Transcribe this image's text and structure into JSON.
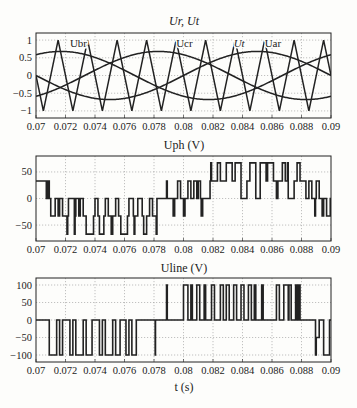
{
  "figure": {
    "plot1_title": "Ur, Ut",
    "plot2_title": "Uph (V)",
    "plot3_title": "Uline (V)",
    "xlabel": "t (s)"
  },
  "chart_data": [
    {
      "type": "line",
      "title": "Ur, Ut",
      "xlabel": "",
      "ylabel": "",
      "xlim": [
        0.07,
        0.09
      ],
      "ylim": [
        -1.2,
        1.2
      ],
      "xticks": [
        "0.07",
        "0.072",
        "0.074",
        "0.076",
        "0.078",
        "0.08",
        "0.082",
        "0.084",
        "0.086",
        "0.088",
        "0.09"
      ],
      "yticks": [
        "1",
        "0.5",
        "0",
        "-0.5",
        "-1"
      ],
      "ytick_values": [
        1,
        0.5,
        0,
        -0.5,
        -1
      ],
      "grid": true,
      "annotations": [
        {
          "text": "Ubr",
          "x": 0.0723,
          "y": 0.92
        },
        {
          "text": "Ucr",
          "x": 0.0795,
          "y": 0.92
        },
        {
          "text": "Ut",
          "x": 0.0834,
          "y": 0.92
        },
        {
          "text": "Uar",
          "x": 0.0855,
          "y": 0.92
        }
      ],
      "series": [
        {
          "name": "Ubr",
          "kind": "sine",
          "amplitude": 0.68,
          "frequency_hz": 50,
          "peak_time": 0.0717
        },
        {
          "name": "Ucr",
          "kind": "sine",
          "amplitude": 0.68,
          "frequency_hz": 50,
          "peak_time": 0.0783
        },
        {
          "name": "Uar",
          "kind": "sine",
          "amplitude": 0.68,
          "frequency_hz": 50,
          "peak_time": 0.085
        },
        {
          "name": "Ut",
          "kind": "triangle",
          "amplitude": 1,
          "period": 0.002,
          "peak_time": 0.0715
        }
      ]
    },
    {
      "type": "line",
      "title": "Uph (V)",
      "xlim": [
        0.07,
        0.09
      ],
      "ylim": [
        -80,
        80
      ],
      "xticks": [
        "0.07",
        "0.072",
        "0.074",
        "0.076",
        "0.078",
        "0.08",
        "0.082",
        "0.084",
        "0.086",
        "0.088",
        "0.09"
      ],
      "yticks": [
        "50",
        "0",
        "-50"
      ],
      "ytick_values": [
        50,
        0,
        -50
      ],
      "grid": true,
      "series": [
        {
          "name": "Uph",
          "kind": "step",
          "x": [
            0.07,
            0.0707,
            0.0708,
            0.0709,
            0.071,
            0.0711,
            0.0713,
            0.0715,
            0.0716,
            0.0718,
            0.0721,
            0.07215,
            0.0722,
            0.0726,
            0.07265,
            0.0727,
            0.0729,
            0.073,
            0.0732,
            0.0734,
            0.0737,
            0.0739,
            0.074,
            0.0742,
            0.0743,
            0.0746,
            0.0747,
            0.0749,
            0.0751,
            0.0752,
            0.0754,
            0.0756,
            0.07575,
            0.076,
            0.0762,
            0.0763,
            0.0766,
            0.07665,
            0.0767,
            0.0769,
            0.0772,
            0.0773,
            0.0775,
            0.0777,
            0.0779,
            0.07815,
            0.0782,
            0.0788,
            0.07885,
            0.0789,
            0.0791,
            0.0793,
            0.0794,
            0.0796,
            0.0798,
            0.08,
            0.0801,
            0.0803,
            0.0805,
            0.0807,
            0.0809,
            0.081,
            0.08115,
            0.0812,
            0.0813,
            0.0816,
            0.0818,
            0.08185,
            0.0819,
            0.0821,
            0.0823,
            0.0825,
            0.0827,
            0.0829,
            0.0831,
            0.0833,
            0.0835,
            0.0836,
            0.0839,
            0.0841,
            0.0843,
            0.0845,
            0.0847,
            0.0849,
            0.0851,
            0.0852,
            0.0854,
            0.0856,
            0.0857,
            0.0859,
            0.0861,
            0.0863,
            0.0864,
            0.0867,
            0.0869,
            0.08705,
            0.0871,
            0.0873,
            0.0875,
            0.0877,
            0.0879,
            0.0881,
            0.0883,
            0.0885,
            0.0887,
            0.0889,
            0.08895,
            0.089,
            0.0892,
            0.0894,
            0.0895,
            0.0897,
            0.0899,
            0.08995,
            0.09
          ],
          "y": [
            33,
            0,
            33,
            0,
            -33,
            -33,
            0,
            -33,
            0,
            -33,
            -67,
            -33,
            0,
            -67,
            -33,
            0,
            -33,
            0,
            -33,
            -67,
            -67,
            -33,
            0,
            -33,
            -67,
            -33,
            0,
            -33,
            -67,
            -33,
            0,
            -33,
            -67,
            -67,
            -33,
            0,
            -33,
            -67,
            -33,
            0,
            -33,
            -67,
            -33,
            0,
            -33,
            -67,
            0,
            0,
            33,
            0,
            0,
            -33,
            0,
            33,
            0,
            -33,
            0,
            33,
            0,
            33,
            0,
            33,
            0,
            -33,
            0,
            0,
            33,
            67,
            33,
            33,
            67,
            33,
            33,
            67,
            67,
            33,
            67,
            67,
            0,
            0,
            33,
            67,
            67,
            0,
            0,
            67,
            67,
            33,
            67,
            67,
            33,
            0,
            33,
            67,
            33,
            67,
            0,
            0,
            33,
            67,
            33,
            33,
            0,
            33,
            0,
            -33,
            0,
            33,
            0,
            -33,
            0,
            -33,
            -33,
            0,
            -33,
            33,
            33
          ]
        }
      ]
    },
    {
      "type": "line",
      "title": "Uline (V)",
      "xlabel": "t (s)",
      "xlim": [
        0.07,
        0.09
      ],
      "ylim": [
        -120,
        120
      ],
      "xticks": [
        "0.07",
        "0.072",
        "0.074",
        "0.076",
        "0.078",
        "0.08",
        "0.082",
        "0.084",
        "0.086",
        "0.088",
        "0.09"
      ],
      "yticks": [
        "100",
        "50",
        "0",
        "-50",
        "-100"
      ],
      "ytick_values": [
        100,
        50,
        0,
        -50,
        -100
      ],
      "grid": true,
      "series": [
        {
          "name": "Uline",
          "kind": "step",
          "x": [
            0.07,
            0.0709,
            0.0714,
            0.0716,
            0.0718,
            0.0723,
            0.0725,
            0.0727,
            0.0732,
            0.0734,
            0.0738,
            0.0743,
            0.0745,
            0.0747,
            0.0752,
            0.0754,
            0.0757,
            0.0761,
            0.0763,
            0.0765,
            0.0768,
            0.077,
            0.07808,
            0.0781,
            0.07812,
            0.0788,
            0.07885,
            0.0789,
            0.0791,
            0.08,
            0.0803,
            0.0805,
            0.0806,
            0.0809,
            0.0811,
            0.0814,
            0.0815,
            0.0819,
            0.0821,
            0.0825,
            0.0827,
            0.0829,
            0.0831,
            0.0834,
            0.0836,
            0.0839,
            0.0841,
            0.0844,
            0.0846,
            0.0848,
            0.0849,
            0.0853,
            0.0854,
            0.0859,
            0.0863,
            0.0865,
            0.0868,
            0.0871,
            0.08715,
            0.0873,
            0.0876,
            0.0877,
            0.0878,
            0.0879,
            0.0889,
            0.08895,
            0.089,
            0.0892,
            0.0894,
            0.0895,
            0.0897,
            0.0899,
            0.09
          ],
          "y": [
            0,
            -100,
            0,
            -100,
            0,
            -100,
            0,
            -100,
            0,
            -100,
            0,
            -100,
            0,
            -100,
            0,
            -100,
            0,
            -100,
            0,
            -100,
            0,
            0,
            -100,
            0,
            0,
            0,
            100,
            0,
            0,
            100,
            0,
            100,
            0,
            100,
            0,
            100,
            0,
            100,
            0,
            100,
            0,
            100,
            0,
            100,
            0,
            100,
            0,
            100,
            0,
            100,
            0,
            100,
            0,
            0,
            100,
            0,
            100,
            0,
            100,
            0,
            100,
            0,
            100,
            0,
            0,
            -100,
            -50,
            0,
            0,
            -100,
            -100,
            0,
            0
          ]
        }
      ]
    }
  ]
}
